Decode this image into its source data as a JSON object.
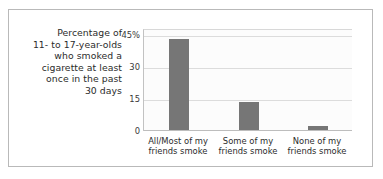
{
  "chart_data": {
    "type": "bar",
    "title": "",
    "subtitle": "",
    "caption_lines": [
      "Percentage of",
      "11- to 17-year-olds",
      "who smoked a",
      "cigarette at least",
      "once in the past",
      "30 days"
    ],
    "categories": [
      "All/Most of my friends smoke",
      "Some of my friends smoke",
      "None of my friends smoke"
    ],
    "category_lines": [
      [
        "All/Most of my",
        "friends smoke"
      ],
      [
        "Some of my",
        "friends smoke"
      ],
      [
        "None of my",
        "friends smoke"
      ]
    ],
    "values": [
      43,
      13,
      2
    ],
    "xlabel": "",
    "ylabel": "",
    "ylim": [
      0,
      48
    ],
    "yticks": [
      45,
      30,
      15,
      0
    ],
    "ytick_labels": [
      "45%",
      "30",
      "15",
      "0"
    ],
    "grid": true,
    "legend": "none",
    "bar_color": "#767676",
    "plot_background": "#fcfcfc",
    "gridline_color": "#dcdcdc",
    "axis_color": "#c2c2c2",
    "frame_color": "#b9b9b9",
    "text_color": "#2b2b2b"
  }
}
